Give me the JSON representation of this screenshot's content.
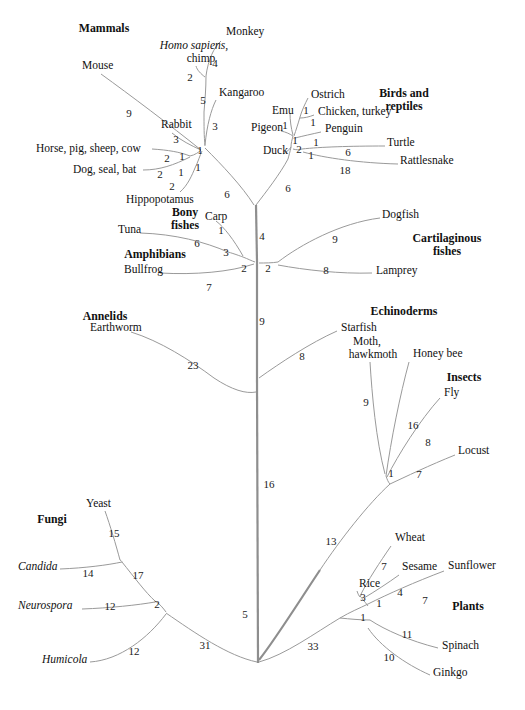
{
  "figure": {
    "type": "phylogenetic-tree",
    "style": "unrooted radial cladogram",
    "line_color": "#9a9a9a",
    "trunk_color": "#8e8e8e",
    "background": "#ffffff",
    "text_color": "#111111"
  },
  "group_labels": [
    {
      "id": "mammals",
      "text": "Mammals",
      "x": 104,
      "y": 28
    },
    {
      "id": "birds-reptiles",
      "text": "Birds and\nreptiles",
      "x": 404,
      "y": 99
    },
    {
      "id": "bony-fishes",
      "text": "Bony\nfishes",
      "x": 185,
      "y": 218
    },
    {
      "id": "cartilaginous-fishes",
      "text": "Cartilaginous\nfishes",
      "x": 447,
      "y": 244
    },
    {
      "id": "amphibians",
      "text": "Amphibians",
      "x": 155,
      "y": 254
    },
    {
      "id": "annelids",
      "text": "Annelids",
      "x": 105,
      "y": 316
    },
    {
      "id": "echinoderms",
      "text": "Echinoderms",
      "x": 404,
      "y": 311
    },
    {
      "id": "insects",
      "text": "Insects",
      "x": 464,
      "y": 377
    },
    {
      "id": "fungi",
      "text": "Fungi",
      "x": 52,
      "y": 519
    },
    {
      "id": "plants",
      "text": "Plants",
      "x": 468,
      "y": 606
    }
  ],
  "taxa": [
    {
      "id": "monkey",
      "text": "Monkey",
      "x": 226,
      "y": 31,
      "align": "left",
      "italic": false
    },
    {
      "id": "homo-sapiens-chimp",
      "text": "Homo sapiens,",
      "x": 194,
      "y": 45,
      "align": "center",
      "italic": true
    },
    {
      "id": "chimp",
      "text": "chimp",
      "x": 201,
      "y": 58,
      "align": "center",
      "italic": false
    },
    {
      "id": "mouse",
      "text": "Mouse",
      "x": 82,
      "y": 65,
      "align": "left",
      "italic": false
    },
    {
      "id": "ostrich",
      "text": "Ostrich",
      "x": 311,
      "y": 94,
      "align": "left",
      "italic": false
    },
    {
      "id": "kangaroo",
      "text": "Kangaroo",
      "x": 219,
      "y": 92,
      "align": "left",
      "italic": false
    },
    {
      "id": "emu",
      "text": "Emu",
      "x": 272,
      "y": 110,
      "align": "left",
      "italic": false
    },
    {
      "id": "chicken-turkey",
      "text": "Chicken, turkey",
      "x": 318,
      "y": 111,
      "align": "left",
      "italic": false
    },
    {
      "id": "rabbit",
      "text": "Rabbit",
      "x": 161,
      "y": 124,
      "align": "left",
      "italic": false
    },
    {
      "id": "pigeon",
      "text": "Pigeon",
      "x": 251,
      "y": 127,
      "align": "left",
      "italic": false
    },
    {
      "id": "penguin",
      "text": "Penguin",
      "x": 325,
      "y": 128,
      "align": "left",
      "italic": false
    },
    {
      "id": "turtle",
      "text": "Turtle",
      "x": 387,
      "y": 142,
      "align": "left",
      "italic": false
    },
    {
      "id": "duck",
      "text": "Duck",
      "x": 263,
      "y": 150,
      "align": "left",
      "italic": false
    },
    {
      "id": "horse-pig-sheep-cow",
      "text": "Horse, pig, sheep, cow",
      "x": 36,
      "y": 148,
      "align": "left",
      "italic": false
    },
    {
      "id": "rattlesnake",
      "text": "Rattlesnake",
      "x": 400,
      "y": 160,
      "align": "left",
      "italic": false
    },
    {
      "id": "dog-seal-bat",
      "text": "Dog, seal, bat",
      "x": 73,
      "y": 169,
      "align": "left",
      "italic": false
    },
    {
      "id": "hippopotamus",
      "text": "Hippopotamus",
      "x": 126,
      "y": 199,
      "align": "left",
      "italic": false
    },
    {
      "id": "carp",
      "text": "Carp",
      "x": 205,
      "y": 216,
      "align": "left",
      "italic": false
    },
    {
      "id": "dogfish",
      "text": "Dogfish",
      "x": 382,
      "y": 214,
      "align": "left",
      "italic": false
    },
    {
      "id": "tuna",
      "text": "Tuna",
      "x": 118,
      "y": 229,
      "align": "left",
      "italic": false
    },
    {
      "id": "bullfrog",
      "text": "Bullfrog",
      "x": 124,
      "y": 269,
      "align": "left",
      "italic": false
    },
    {
      "id": "lamprey",
      "text": "Lamprey",
      "x": 376,
      "y": 270,
      "align": "left",
      "italic": false
    },
    {
      "id": "earthworm",
      "text": "Earthworm",
      "x": 90,
      "y": 327,
      "align": "left",
      "italic": false
    },
    {
      "id": "starfish",
      "text": "Starfish",
      "x": 341,
      "y": 327,
      "align": "left",
      "italic": false
    },
    {
      "id": "moth",
      "text": "Moth,",
      "x": 367,
      "y": 341,
      "align": "center",
      "italic": false
    },
    {
      "id": "hawkmoth",
      "text": "hawkmoth",
      "x": 373,
      "y": 354,
      "align": "center",
      "italic": false
    },
    {
      "id": "honey-bee",
      "text": "Honey bee",
      "x": 413,
      "y": 353,
      "align": "left",
      "italic": false
    },
    {
      "id": "fly",
      "text": "Fly",
      "x": 444,
      "y": 392,
      "align": "left",
      "italic": false
    },
    {
      "id": "locust",
      "text": "Locust",
      "x": 458,
      "y": 450,
      "align": "left",
      "italic": false
    },
    {
      "id": "yeast",
      "text": "Yeast",
      "x": 86,
      "y": 503,
      "align": "left",
      "italic": false
    },
    {
      "id": "candida",
      "text": "Candida",
      "x": 18,
      "y": 566,
      "align": "left",
      "italic": true
    },
    {
      "id": "wheat",
      "text": "Wheat",
      "x": 395,
      "y": 537,
      "align": "left",
      "italic": false
    },
    {
      "id": "sesame",
      "text": "Sesame",
      "x": 402,
      "y": 566,
      "align": "left",
      "italic": false
    },
    {
      "id": "sunflower",
      "text": "Sunflower",
      "x": 448,
      "y": 565,
      "align": "left",
      "italic": false
    },
    {
      "id": "neurospora",
      "text": "Neurospora",
      "x": 18,
      "y": 605,
      "align": "left",
      "italic": true
    },
    {
      "id": "rice",
      "text": "Rice",
      "x": 359,
      "y": 583,
      "align": "left",
      "italic": false
    },
    {
      "id": "spinach",
      "text": "Spinach",
      "x": 442,
      "y": 645,
      "align": "left",
      "italic": false
    },
    {
      "id": "humicola",
      "text": "Humicola",
      "x": 42,
      "y": 659,
      "align": "left",
      "italic": true
    },
    {
      "id": "ginkgo",
      "text": "Ginkgo",
      "x": 433,
      "y": 672,
      "align": "left",
      "italic": false
    }
  ],
  "branch_lengths": [
    {
      "id": "d-monkey",
      "value": "4",
      "x": 215,
      "y": 63
    },
    {
      "id": "d-homo-chimp",
      "value": "2",
      "x": 190,
      "y": 77
    },
    {
      "id": "d-mouse",
      "value": "9",
      "x": 129,
      "y": 113
    },
    {
      "id": "d-primate-kangaroo-split",
      "value": "5",
      "x": 203,
      "y": 100
    },
    {
      "id": "d-kangaroo",
      "value": "3",
      "x": 215,
      "y": 126
    },
    {
      "id": "d-ostrich",
      "value": "1",
      "x": 306,
      "y": 110
    },
    {
      "id": "d-emu",
      "value": "1",
      "x": 285,
      "y": 125
    },
    {
      "id": "d-chicken",
      "value": "1",
      "x": 313,
      "y": 122
    },
    {
      "id": "d-rabbit",
      "value": "3",
      "x": 176,
      "y": 139
    },
    {
      "id": "d-pigeon",
      "value": "1",
      "x": 295,
      "y": 140
    },
    {
      "id": "d-penguin",
      "value": "1",
      "x": 316,
      "y": 142
    },
    {
      "id": "d-bird-node",
      "value": "2",
      "x": 299,
      "y": 149
    },
    {
      "id": "d-turtle",
      "value": "6",
      "x": 348,
      "y": 152
    },
    {
      "id": "d-archosaur",
      "value": "1",
      "x": 311,
      "y": 155
    },
    {
      "id": "d-mammal-node",
      "value": "1",
      "x": 200,
      "y": 150
    },
    {
      "id": "d-ungulate",
      "value": "2",
      "x": 167,
      "y": 158
    },
    {
      "id": "d-laurasiatheria",
      "value": "1",
      "x": 182,
      "y": 156
    },
    {
      "id": "d-rattlesnake",
      "value": "18",
      "x": 345,
      "y": 170
    },
    {
      "id": "d-carnivore",
      "value": "2",
      "x": 160,
      "y": 174
    },
    {
      "id": "d-cetartiodactyl",
      "value": "1",
      "x": 181,
      "y": 172
    },
    {
      "id": "d-mammal-root",
      "value": "1",
      "x": 198,
      "y": 167
    },
    {
      "id": "d-hippo",
      "value": "2",
      "x": 172,
      "y": 186
    },
    {
      "id": "d-mammal-stem",
      "value": "6",
      "x": 227,
      "y": 194
    },
    {
      "id": "d-bird-stem",
      "value": "6",
      "x": 288,
      "y": 188
    },
    {
      "id": "d-carp",
      "value": "1",
      "x": 221,
      "y": 230
    },
    {
      "id": "d-tetrapod",
      "value": "4",
      "x": 262,
      "y": 236
    },
    {
      "id": "d-dogfish",
      "value": "9",
      "x": 335,
      "y": 239
    },
    {
      "id": "d-tuna",
      "value": "6",
      "x": 197,
      "y": 243
    },
    {
      "id": "d-bony-fish",
      "value": "3",
      "x": 226,
      "y": 252
    },
    {
      "id": "d-gnathostome",
      "value": "2",
      "x": 244,
      "y": 268
    },
    {
      "id": "d-chordate",
      "value": "2",
      "x": 268,
      "y": 268
    },
    {
      "id": "d-lamprey",
      "value": "8",
      "x": 326,
      "y": 270
    },
    {
      "id": "d-bullfrog",
      "value": "7",
      "x": 209,
      "y": 287
    },
    {
      "id": "d-vertebrate-stem",
      "value": "9",
      "x": 262,
      "y": 321
    },
    {
      "id": "d-starfish",
      "value": "8",
      "x": 302,
      "y": 356
    },
    {
      "id": "d-earthworm",
      "value": "23",
      "x": 193,
      "y": 365
    },
    {
      "id": "d-moth",
      "value": "9",
      "x": 366,
      "y": 402
    },
    {
      "id": "d-honeybee",
      "value": "16",
      "x": 413,
      "y": 425
    },
    {
      "id": "d-fly",
      "value": "8",
      "x": 428,
      "y": 442
    },
    {
      "id": "d-insect-node",
      "value": "1",
      "x": 391,
      "y": 473
    },
    {
      "id": "d-locust",
      "value": "7",
      "x": 419,
      "y": 474
    },
    {
      "id": "d-metazoa-stem",
      "value": "16",
      "x": 269,
      "y": 484
    },
    {
      "id": "d-yeast",
      "value": "15",
      "x": 114,
      "y": 533
    },
    {
      "id": "d-protostome-stem",
      "value": "13",
      "x": 331,
      "y": 541
    },
    {
      "id": "d-candida",
      "value": "14",
      "x": 88,
      "y": 573
    },
    {
      "id": "d-ascomycete",
      "value": "17",
      "x": 138,
      "y": 575
    },
    {
      "id": "d-wheat",
      "value": "7",
      "x": 384,
      "y": 566
    },
    {
      "id": "d-sesame",
      "value": "4",
      "x": 400,
      "y": 592
    },
    {
      "id": "d-sunflower",
      "value": "7",
      "x": 425,
      "y": 600
    },
    {
      "id": "d-neurospora",
      "value": "12",
      "x": 110,
      "y": 606
    },
    {
      "id": "d-fungi-node",
      "value": "2",
      "x": 157,
      "y": 604
    },
    {
      "id": "d-rice",
      "value": "3",
      "x": 363,
      "y": 597
    },
    {
      "id": "d-angiosperm",
      "value": "1",
      "x": 379,
      "y": 603
    },
    {
      "id": "d-eukaryote-root",
      "value": "5",
      "x": 245,
      "y": 614
    },
    {
      "id": "d-seed-plant",
      "value": "1",
      "x": 363,
      "y": 617
    },
    {
      "id": "d-spinach",
      "value": "11",
      "x": 407,
      "y": 634
    },
    {
      "id": "d-humicola",
      "value": "12",
      "x": 134,
      "y": 651
    },
    {
      "id": "d-fungi-stem",
      "value": "31",
      "x": 205,
      "y": 645
    },
    {
      "id": "d-plant-stem",
      "value": "33",
      "x": 313,
      "y": 646
    },
    {
      "id": "d-ginkgo",
      "value": "10",
      "x": 389,
      "y": 657
    }
  ],
  "branch_paths": [
    {
      "id": "p-monkey",
      "d": "M 221 41 C 214 47 208 60 206 76"
    },
    {
      "id": "p-homo-chimp",
      "d": "M 196 66 C 197 70 201 74 205 77"
    },
    {
      "id": "p-primate-stem",
      "d": "M 206 76 C 206 88 205 100 204 112"
    },
    {
      "id": "p-kangaroo-to-node",
      "d": "M 216 100 C 211 110 207 125 205 145"
    },
    {
      "id": "p-primate-to-mammnode",
      "d": "M 204 112 C 204 126 204 136 205 146"
    },
    {
      "id": "p-mouse",
      "d": "M 101 74 C 130 95 170 125 201 150"
    },
    {
      "id": "p-rabbit",
      "d": "M 172 133 C 180 140 192 146 201 150"
    },
    {
      "id": "p-ungulate",
      "d": "M 152 149 C 168 150 180 152 190 156"
    },
    {
      "id": "p-carnivore",
      "d": "M 143 170 C 160 170 174 165 190 157"
    },
    {
      "id": "p-laurasia-to-node",
      "d": "M 190 156 C 195 155 199 152 201 150"
    },
    {
      "id": "p-hippo",
      "d": "M 180 192 C 188 185 192 175 195 168"
    },
    {
      "id": "p-hippo-to-node",
      "d": "M 195 168 C 198 162 200 155 202 151"
    },
    {
      "id": "p-mammal-stem",
      "d": "M 205 148 C 222 165 242 186 254 205"
    },
    {
      "id": "p-ostrich",
      "d": "M 308 98 C 305 104 302 110 300 117"
    },
    {
      "id": "p-chicken",
      "d": "M 314 115 C 309 117 304 118 300 118"
    },
    {
      "id": "p-ostrich-node-down",
      "d": "M 300 117 C 298 124 296 130 294 136"
    },
    {
      "id": "p-emu",
      "d": "M 290 113 C 290 120 291 128 293 135"
    },
    {
      "id": "p-pigeon",
      "d": "M 281 131 C 286 132 290 134 293 136"
    },
    {
      "id": "p-penguin",
      "d": "M 321 132 C 312 134 303 136 295 138"
    },
    {
      "id": "p-bird-inner",
      "d": "M 293 136 C 292 140 291 143 291 147"
    },
    {
      "id": "p-duck",
      "d": "M 283 154 C 287 152 289 150 291 147"
    },
    {
      "id": "p-turtle",
      "d": "M 385 146 C 350 146 320 147 302 149"
    },
    {
      "id": "p-rattlesnake",
      "d": "M 398 164 C 360 163 325 158 303 152"
    },
    {
      "id": "p-turtle-rattle-node",
      "d": "M 302 149 C 299 150 296 150 293 149"
    },
    {
      "id": "p-bird-to-stem",
      "d": "M 291 147 C 290 152 289 155 288 159"
    },
    {
      "id": "p-bird-stem",
      "d": "M 288 159 C 280 174 266 192 256 205"
    },
    {
      "id": "p-trunk-top",
      "d": "M 256 205 L 257 262"
    },
    {
      "id": "p-carp",
      "d": "M 216 221 C 224 227 234 240 243 256"
    },
    {
      "id": "p-tuna",
      "d": "M 140 233 C 175 234 205 242 228 252"
    },
    {
      "id": "p-tuna-carp-join",
      "d": "M 228 252 C 235 254 240 256 243 257"
    },
    {
      "id": "p-bonyfish-to-node",
      "d": "M 243 257 C 248 259 252 261 255 262"
    },
    {
      "id": "p-bullfrog",
      "d": "M 160 273 C 195 275 230 272 254 264"
    },
    {
      "id": "p-dogfish",
      "d": "M 380 218 C 340 223 300 245 278 262"
    },
    {
      "id": "p-lamprey",
      "d": "M 372 273 C 340 274 305 270 278 265"
    },
    {
      "id": "p-chordate-node",
      "d": "M 278 262 C 272 263 265 263 259 263"
    },
    {
      "id": "p-trunk-mid",
      "d": "M 257 262 L 257 380"
    },
    {
      "id": "p-starfish",
      "d": "M 337 331 C 310 343 280 363 259 378"
    },
    {
      "id": "p-earthworm",
      "d": "M 131 332 C 160 341 190 360 214 378"
    },
    {
      "id": "p-earthworm-join",
      "d": "M 214 378 C 232 390 246 394 256 392"
    },
    {
      "id": "p-trunk-lower",
      "d": "M 257 380 L 258 663"
    },
    {
      "id": "p-moth",
      "d": "M 370 362 C 372 395 376 440 385 474"
    },
    {
      "id": "p-honeybee",
      "d": "M 409 362 C 400 395 391 440 386 476"
    },
    {
      "id": "p-fly",
      "d": "M 440 398 C 420 420 398 455 387 477"
    },
    {
      "id": "p-locust",
      "d": "M 455 455 C 430 465 405 477 390 484"
    },
    {
      "id": "p-insect-node",
      "d": "M 386 476 C 387 479 388 482 390 484"
    },
    {
      "id": "p-insect-stem",
      "d": "M 390 484 C 368 504 340 540 320 570"
    },
    {
      "id": "p-protostome-to-trunk",
      "d": "M 320 570 C 300 600 275 640 259 660"
    },
    {
      "id": "p-yeast",
      "d": "M 105 511 C 110 525 116 545 120 560"
    },
    {
      "id": "p-candida",
      "d": "M 60 569 C 85 568 108 565 122 562"
    },
    {
      "id": "p-ascomycete-node",
      "d": "M 120 560 C 122 561 122 562 122 562"
    },
    {
      "id": "p-ascomycete-stem",
      "d": "M 122 562 C 134 577 146 593 155 601"
    },
    {
      "id": "p-neurospora",
      "d": "M 82 609 C 110 608 138 605 155 602"
    },
    {
      "id": "p-fungi-node",
      "d": "M 155 601 C 160 604 163 608 166 612"
    },
    {
      "id": "p-humicola",
      "d": "M 90 662 C 120 660 148 638 166 614"
    },
    {
      "id": "p-fungi-stem",
      "d": "M 166 613 C 195 633 228 656 257 662"
    },
    {
      "id": "p-wheat",
      "d": "M 391 546 C 380 562 368 580 360 596"
    },
    {
      "id": "p-sesame",
      "d": "M 399 575 C 388 583 374 592 364 598"
    },
    {
      "id": "p-rice",
      "d": "M 357 591 C 358 594 359 596 360 597"
    },
    {
      "id": "p-angiosperm-node",
      "d": "M 360 596 C 362 598 363 600 364 601"
    },
    {
      "id": "p-sunflower",
      "d": "M 444 571 C 415 582 388 594 368 604"
    },
    {
      "id": "p-angiosperm-stem",
      "d": "M 364 601 C 366 603 367 605 368 606"
    },
    {
      "id": "p-seedplant-node",
      "d": "M 368 604 C 360 608 350 612 340 618"
    },
    {
      "id": "p-spinach",
      "d": "M 438 648 C 410 641 385 630 370 620"
    },
    {
      "id": "p-ginkgo",
      "d": "M 430 675 C 405 664 380 646 368 628"
    },
    {
      "id": "p-plant-inner",
      "d": "M 370 620 C 360 620 350 619 340 618"
    },
    {
      "id": "p-plant-stem",
      "d": "M 340 618 C 315 633 285 655 259 662"
    }
  ]
}
